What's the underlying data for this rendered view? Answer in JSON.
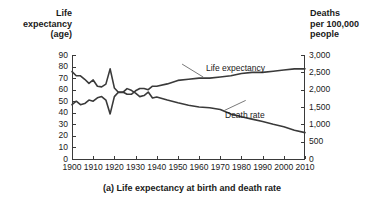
{
  "caption": "(a) Life expectancy at birth and death rate",
  "axes": {
    "left_title": "Life\nexpectancy\n(age)",
    "right_title": "Deaths\nper 100,000\npeople",
    "left_ticks": [
      "90",
      "80",
      "70",
      "60",
      "50",
      "40",
      "30",
      "20",
      "10",
      "0"
    ],
    "right_ticks": [
      "3,000",
      "2,500",
      "2,000",
      "1,500",
      "1,000",
      "500",
      "0"
    ],
    "x_ticks": [
      "1900",
      "1910",
      "1920",
      "1930",
      "1940",
      "1950",
      "1960",
      "1970",
      "1980",
      "1990",
      "2000",
      "2010"
    ]
  },
  "annotations": {
    "life_expectancy": "Life expectancy",
    "death_rate": "Death rate"
  },
  "colors": {
    "line": "#3a3a3a",
    "axis": "#3a3a3a",
    "text": "#1a1a1a",
    "background": "#ffffff"
  },
  "chart_data": {
    "type": "line",
    "title": "(a) Life expectancy at birth and death rate",
    "xlabel": "",
    "ylabel": "Life expectancy (age)",
    "y2label": "Deaths per 100,000 people",
    "xlim": [
      1900,
      2010
    ],
    "ylim": [
      0,
      90
    ],
    "y2lim": [
      0,
      3000
    ],
    "grid": false,
    "legend": "annotations-on-plot",
    "x": [
      1900,
      1902,
      1904,
      1906,
      1908,
      1910,
      1912,
      1914,
      1916,
      1918,
      1920,
      1922,
      1924,
      1926,
      1928,
      1930,
      1932,
      1934,
      1936,
      1938,
      1940,
      1945,
      1950,
      1955,
      1960,
      1965,
      1970,
      1975,
      1980,
      1985,
      1990,
      1995,
      2000,
      2005,
      2010
    ],
    "series": [
      {
        "name": "Life expectancy",
        "axis": "left",
        "unit": "age (years)",
        "values": [
          47,
          50,
          47,
          48,
          51,
          50,
          53,
          54,
          51,
          39,
          54,
          58,
          58,
          56,
          56,
          59,
          61,
          61,
          60,
          63,
          63,
          65,
          68,
          69,
          70,
          70,
          71,
          72,
          74,
          75,
          75,
          76,
          77,
          78,
          78
        ]
      },
      {
        "name": "Death rate",
        "axis": "right",
        "unit": "deaths per 100,000 people",
        "values": [
          2520,
          2400,
          2400,
          2300,
          2180,
          2280,
          2100,
          2080,
          2160,
          2600,
          2050,
          1920,
          1920,
          2030,
          1980,
          1900,
          1800,
          1830,
          1930,
          1760,
          1790,
          1700,
          1620,
          1550,
          1500,
          1480,
          1430,
          1300,
          1220,
          1150,
          1080,
          1000,
          930,
          830,
          760
        ]
      }
    ]
  }
}
